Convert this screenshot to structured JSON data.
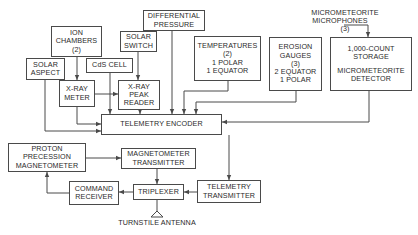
{
  "diagram": {
    "blocks": {
      "ion_chambers": {
        "lines": [
          "ION",
          "CHAMBERS",
          "(2)"
        ]
      },
      "solar_aspect": {
        "lines": [
          "SOLAR",
          "ASPECT"
        ]
      },
      "cds_cell": {
        "lines": [
          "CdS CELL"
        ]
      },
      "xray_meter": {
        "lines": [
          "X-RAY",
          "METER"
        ]
      },
      "solar_switch": {
        "lines": [
          "SOLAR",
          "SWITCH"
        ]
      },
      "xray_peak_reader": {
        "lines": [
          "X-RAY",
          "PEAK",
          "READER"
        ]
      },
      "differential_pressure": {
        "lines": [
          "DIFFERENTIAL",
          "PRESSURE"
        ]
      },
      "temperatures": {
        "lines": [
          "TEMPERATURES",
          "(2)",
          "1 POLAR",
          "1 EQUATOR"
        ]
      },
      "erosion_gauges": {
        "lines": [
          "EROSION",
          "GAUGES",
          "(3)",
          "2 EQUATOR",
          "1 POLAR"
        ]
      },
      "micrometeorite_detector": {
        "lines": [
          "1,000-COUNT",
          "STORAGE",
          "MICROMETEORITE",
          "DETECTOR"
        ]
      },
      "telemetry_encoder": {
        "lines": [
          "TELEMETRY ENCODER"
        ]
      },
      "proton_magnetometer": {
        "lines": [
          "PROTON",
          "PRECESSION",
          "MAGNETOMETER"
        ]
      },
      "magnetometer_transmitter": {
        "lines": [
          "MAGNETOMETER",
          "TRANSMITTER"
        ]
      },
      "command_receiver": {
        "lines": [
          "COMMAND",
          "RECEIVER"
        ]
      },
      "triplexer": {
        "lines": [
          "TRIPLEXER"
        ]
      },
      "telemetry_transmitter": {
        "lines": [
          "TELEMETRY",
          "TRANSMITTER"
        ]
      }
    },
    "labels": {
      "micrometeorite_microphones": [
        "MICROMETEORITE",
        "MICROPHONES",
        "(3)"
      ],
      "turnstile_antenna": "TURNSTILE ANTENNA"
    },
    "colors": {
      "line": "#4a4a4a",
      "text": "#2a2a2a",
      "background": "#ffffff"
    }
  }
}
